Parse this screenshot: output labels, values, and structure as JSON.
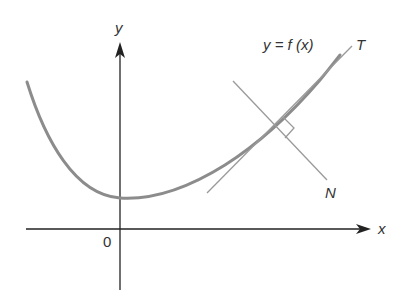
{
  "diagram": {
    "labels": {
      "y_axis": "y",
      "x_axis": "x",
      "origin": "0",
      "curve": "y = f (x)",
      "tangent": "T",
      "normal": "N"
    },
    "colors": {
      "axis": "#222222",
      "curve": "#8c8c8c",
      "lines": "#9a9a9a",
      "text": "#333333"
    }
  }
}
